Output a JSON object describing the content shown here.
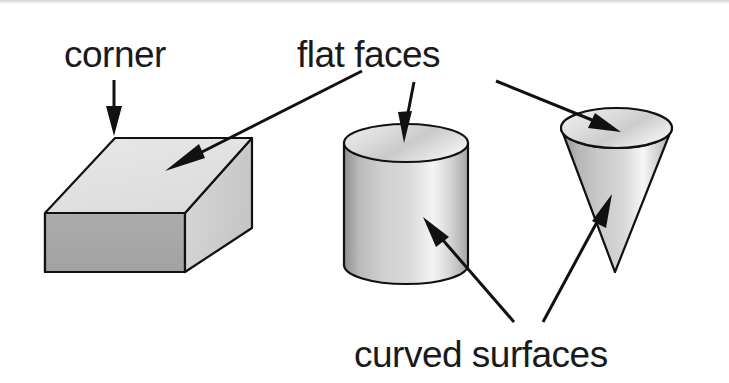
{
  "figure": {
    "background_color": "#ffffff",
    "ink_color": "#1a1a1a",
    "width": 729,
    "height": 383
  },
  "labels": {
    "corner": "corner",
    "flat_faces": "flat faces",
    "curved_surfaces": "curved surfaces"
  },
  "shapes": [
    {
      "name": "cuboid",
      "label": "cuboid",
      "top_face_color": "#e3e3e3",
      "front_face_color": "#a8a8a8",
      "side_face_color": "#d2d2d2"
    },
    {
      "name": "cylinder",
      "label": "cylinder",
      "top_face_color": "#d8d8d8",
      "body_highlight_color": "#f2f2f2",
      "body_shadow_color": "#9e9e9e"
    },
    {
      "name": "cone",
      "label": "cone",
      "top_face_color": "#dcdcdc",
      "body_highlight_color": "#f4f4f4",
      "body_shadow_color": "#9a9a9a"
    }
  ],
  "annotations": [
    {
      "name": "corner-to-cuboid",
      "label": "corner",
      "target_shape": "cuboid",
      "feature": "corner"
    },
    {
      "name": "flat-faces-to-cuboid",
      "label": "flat faces",
      "target_shape": "cuboid",
      "feature": "flat face"
    },
    {
      "name": "flat-faces-to-cylinder",
      "label": "flat faces",
      "target_shape": "cylinder",
      "feature": "flat face"
    },
    {
      "name": "flat-faces-to-cone",
      "label": "flat faces",
      "target_shape": "cone",
      "feature": "flat face"
    },
    {
      "name": "curved-surfaces-to-cylinder",
      "label": "curved surfaces",
      "target_shape": "cylinder",
      "feature": "curved surface"
    },
    {
      "name": "curved-surfaces-to-cone",
      "label": "curved surfaces",
      "target_shape": "cone",
      "feature": "curved surface"
    }
  ]
}
